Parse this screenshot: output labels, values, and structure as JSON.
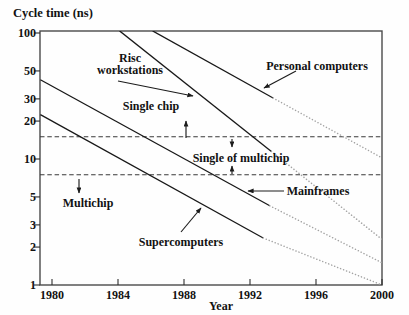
{
  "chart_data": {
    "type": "line",
    "title": "Cycle time (ns)",
    "xlabel": "Year",
    "ylabel": "Cycle time (ns)",
    "y_scale": "log",
    "x_ticks": [
      1980,
      1984,
      1988,
      1992,
      1996,
      2000
    ],
    "y_ticks": [
      100,
      50,
      30,
      20,
      10,
      5,
      3,
      2,
      1
    ],
    "x_range": [
      1979.3,
      2000
    ],
    "y_range": [
      1,
      104
    ],
    "grid": false,
    "region_boundaries_ns": [
      15,
      7.5
    ],
    "projection_style": "dotted lines after ~1993 are extrapolated trends",
    "series": [
      {
        "name": "Supercomputers",
        "solid": [
          [
            1979.3,
            22.5
          ],
          [
            1992.8,
            2.36
          ]
        ],
        "projected": [
          [
            1992.8,
            2.36
          ],
          [
            2000,
            1.0
          ]
        ]
      },
      {
        "name": "Mainframes",
        "solid": [
          [
            1979.3,
            42.5
          ],
          [
            1993.2,
            4.25
          ]
        ],
        "projected": [
          [
            1993.2,
            4.25
          ],
          [
            2000,
            1.5
          ]
        ]
      },
      {
        "name": "Risc workstations",
        "solid": [
          [
            1984.1,
            104
          ],
          [
            1993.3,
            11.5
          ]
        ],
        "projected": [
          [
            1993.3,
            11.5
          ],
          [
            2000,
            2.3
          ]
        ]
      },
      {
        "name": "Personal computers",
        "solid": [
          [
            1986.1,
            104
          ],
          [
            1993.4,
            30.5
          ]
        ],
        "projected": [
          [
            1993.4,
            30.5
          ],
          [
            2000,
            10.2
          ]
        ]
      }
    ],
    "annotations": [
      {
        "lines": [
          "Risc",
          "workstations"
        ],
        "points_to": "Risc workstations line"
      },
      {
        "label": "Personal computers",
        "points_to": "Personal computers line"
      },
      {
        "label": "Single chip",
        "region": "above 15 ns boundary"
      },
      {
        "label": "Single of multichip",
        "region": "between 15 ns and 7.5 ns boundaries"
      },
      {
        "label": "Mainframes",
        "points_to": "Mainframes line"
      },
      {
        "label": "Multichip",
        "region": "below 7.5 ns boundary"
      },
      {
        "label": "Supercomputers",
        "points_to": "Supercomputers line"
      }
    ],
    "colors": {
      "line": "#181818",
      "projection": "#a3a3a3",
      "boundary_dash": "#3a3a3a",
      "text": "#121212",
      "background": "#fefefe"
    }
  }
}
